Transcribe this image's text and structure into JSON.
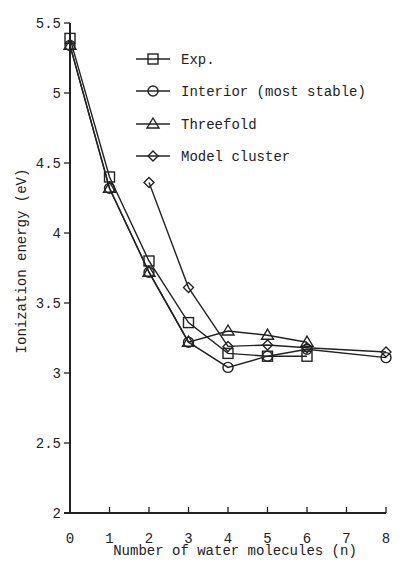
{
  "chart_data": {
    "type": "line",
    "title": "",
    "xlabel": "Number of water molecules (n)",
    "ylabel": "Ionization energy (eV)",
    "xlim": [
      0,
      8
    ],
    "ylim": [
      2,
      5.5
    ],
    "xticks": [
      0,
      1,
      2,
      3,
      4,
      5,
      6,
      7,
      8
    ],
    "xtick_labels": [
      "0",
      "1",
      "2",
      "3",
      "4",
      "5",
      "6",
      "7",
      "8"
    ],
    "yticks": [
      2,
      2.5,
      3,
      3.5,
      4,
      4.5,
      5,
      5.5
    ],
    "ytick_labels": [
      "2",
      "2.5",
      "3",
      "3.5",
      "4",
      "4.5",
      "5",
      "5.5"
    ],
    "grid": false,
    "legend_position": "upper right (inside plot)",
    "series": [
      {
        "name": "Exp.",
        "marker": "square",
        "x": [
          0,
          1,
          2,
          3,
          4,
          5,
          6
        ],
        "values": [
          5.39,
          4.4,
          3.8,
          3.36,
          3.14,
          3.12,
          3.12
        ]
      },
      {
        "name": "Interior (most stable)",
        "marker": "circle",
        "x": [
          0,
          1,
          2,
          3,
          4,
          5,
          6,
          8
        ],
        "values": [
          5.34,
          4.32,
          3.72,
          3.22,
          3.04,
          3.12,
          3.17,
          3.11
        ]
      },
      {
        "name": "Threefold",
        "marker": "triangle",
        "x": [
          0,
          1,
          2,
          3,
          4,
          5,
          6
        ],
        "values": [
          5.34,
          4.32,
          3.72,
          3.22,
          3.3,
          3.27,
          3.22
        ]
      },
      {
        "name": "Model cluster",
        "marker": "diamond",
        "x": [
          2,
          3,
          4,
          5,
          6,
          8
        ],
        "values": [
          4.36,
          3.61,
          3.19,
          3.2,
          3.18,
          3.15
        ]
      }
    ]
  },
  "colors": {
    "line": "#222222",
    "background": "#ffffff"
  }
}
